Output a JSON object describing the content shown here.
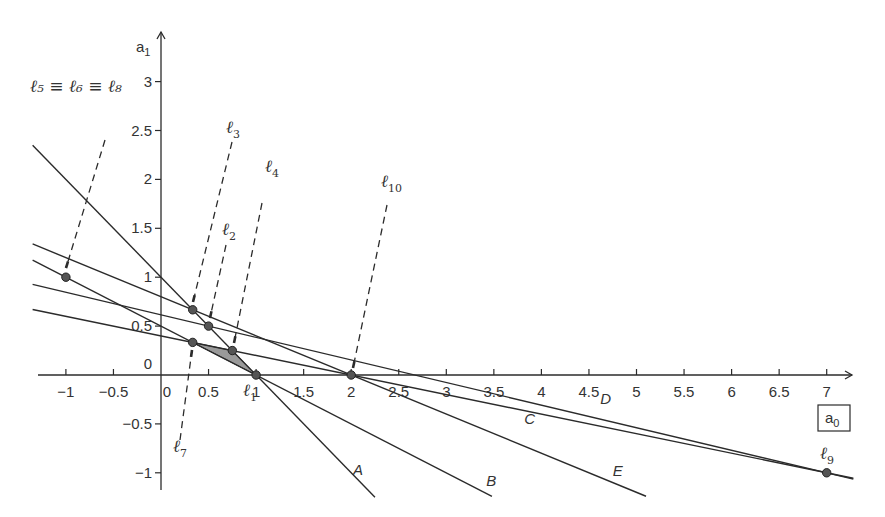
{
  "diagram": {
    "type": "linear-constraint-plot",
    "x_axis": {
      "label": "a",
      "label_sub": "0",
      "boxed": true,
      "range": [
        -1.35,
        7.3
      ],
      "ticks": [
        "-1",
        "-0.5",
        "0",
        "0.5",
        "1",
        "1.5",
        "2",
        "2.5",
        "3",
        "3.5",
        "4",
        "4.5",
        "5",
        "5.5",
        "6",
        "6.5",
        "7"
      ],
      "tick_values": [
        -1,
        -0.5,
        0,
        0.5,
        1,
        1.5,
        2,
        2.5,
        3,
        3.5,
        4,
        4.5,
        5,
        5.5,
        6,
        6.5,
        7
      ]
    },
    "y_axis": {
      "label": "a",
      "label_sub": "1",
      "range": [
        -1.2,
        3.3
      ],
      "ticks": [
        "3",
        "2.5",
        "2",
        "1.5",
        "1",
        "0.5",
        "0",
        "-0.5",
        "-1"
      ],
      "tick_values": [
        3,
        2.5,
        2,
        1.5,
        1,
        0.5,
        0,
        -0.5,
        -1
      ]
    },
    "lines": [
      {
        "name": "A",
        "slope": -1,
        "intercept": 1,
        "x_start": -1.35,
        "x_end": 2.25,
        "label_at": [
          2.02,
          -1.02
        ]
      },
      {
        "name": "B",
        "slope": -0.5,
        "intercept": 0.5,
        "x_start": -1.35,
        "x_end": 3.48,
        "label_at": [
          3.42,
          -1.13
        ]
      },
      {
        "name": "C",
        "slope": -0.2,
        "intercept": 0.4,
        "x_start": -1.35,
        "x_end": 7.28,
        "label_at": [
          3.82,
          -0.5
        ]
      },
      {
        "name": "D",
        "slope": -0.2308,
        "intercept": 0.6154,
        "x_start": -1.35,
        "x_end": 7.28,
        "label_at": [
          4.62,
          -0.3
        ]
      },
      {
        "name": "E",
        "slope": -0.4,
        "intercept": 0.8,
        "x_start": -1.35,
        "x_end": 5.1,
        "label_at": [
          4.75,
          -1.03
        ]
      }
    ],
    "points": [
      {
        "name": "l5=l6=l8",
        "x": -1,
        "y": 1
      },
      {
        "name": "l3",
        "x": 0.3333,
        "y": 0.6667
      },
      {
        "name": "l2",
        "x": 0.5,
        "y": 0.5
      },
      {
        "name": "l7",
        "x": 0.3333,
        "y": 0.3333
      },
      {
        "name": "l4",
        "x": 0.75,
        "y": 0.25
      },
      {
        "name": "l1",
        "x": 1,
        "y": 0
      },
      {
        "name": "l10",
        "x": 2,
        "y": 0
      },
      {
        "name": "l9",
        "x": 7,
        "y": -1
      }
    ],
    "feasible_region": {
      "vertices": [
        [
          0.3333,
          0.3333
        ],
        [
          0.75,
          0.25
        ],
        [
          1,
          0
        ]
      ],
      "fill": "#9a9a9a"
    },
    "labels": {
      "l5_l6_l8": {
        "text": "ℓ₅ ≡ ℓ₆ ≡ ℓ₈"
      },
      "l3": {
        "main": "ℓ",
        "sub": "3"
      },
      "l4": {
        "main": "ℓ",
        "sub": "4"
      },
      "l2": {
        "main": "ℓ",
        "sub": "2"
      },
      "l10": {
        "main": "ℓ",
        "sub": "10"
      },
      "l7": {
        "main": "ℓ",
        "sub": "7"
      },
      "l1": {
        "main": "ℓ",
        "sub": "1"
      },
      "l9": {
        "main": "ℓ",
        "sub": "9"
      }
    },
    "colors": {
      "line": "#2b2b2b",
      "point": "#555555",
      "shade": "#9a9a9a",
      "text": "#333333"
    }
  }
}
